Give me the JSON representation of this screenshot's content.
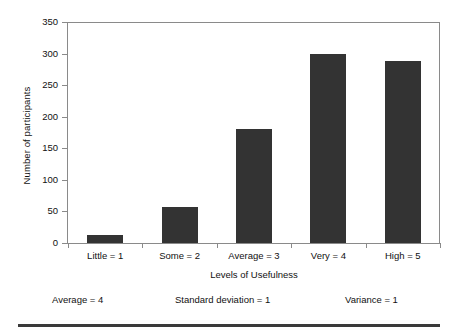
{
  "chart_data": {
    "type": "bar",
    "title": "",
    "subtitle": "",
    "categories": [
      "Little = 1",
      "Some = 2",
      "Average = 3",
      "Very = 4",
      "High = 5"
    ],
    "values": [
      12,
      57,
      180,
      300,
      288
    ],
    "xlabel": "Levels of Usefulness",
    "ylabel": "Number of participants",
    "ylim": [
      0,
      350
    ],
    "yticks": [
      0,
      50,
      100,
      150,
      200,
      250,
      300,
      350
    ],
    "ytick_labels": [
      "0",
      "50",
      "100",
      "150",
      "200",
      "250",
      "300",
      "350"
    ],
    "grid": false,
    "legend": false,
    "legend_position": "none",
    "bar_color": "#333333",
    "axis_color": "#8a8a8a",
    "annotations": [
      {
        "text": "Average = 4"
      },
      {
        "text": "Standard deviation = 1"
      },
      {
        "text": "Variance = 1"
      }
    ]
  },
  "figure": {
    "background_color": "#ffffff",
    "rule_color": "#3a3a3a"
  }
}
